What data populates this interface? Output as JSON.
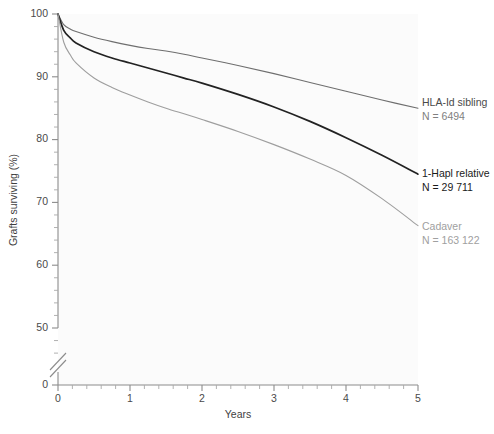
{
  "chart_data": {
    "type": "line",
    "title": "",
    "subtitle": "",
    "xlabel": "Years",
    "ylabel": "Grafts surviving (%)",
    "xlim": [
      0,
      5
    ],
    "ylim": [
      50,
      100
    ],
    "y_axis_break": true,
    "y_break_label": "0",
    "grid": false,
    "legend_position": "right-inline-annotations",
    "x_ticks": [
      "0",
      "1",
      "2",
      "3",
      "4",
      "5"
    ],
    "x_tick_values": [
      0,
      1,
      2,
      3,
      4,
      5
    ],
    "x_minor_ticks_per_interval": 4,
    "y_ticks": [
      "100",
      "90",
      "80",
      "70",
      "60",
      "50"
    ],
    "y_tick_values": [
      100,
      90,
      80,
      70,
      60,
      50
    ],
    "y_minor_ticks_per_interval": 4,
    "series": [
      {
        "name": "HLA-Id sibling",
        "label": "HLA-Id sibling",
        "n_label": "N = 6494",
        "n_value": 6494,
        "color": "#6e6e6e",
        "stroke_width": 1.1,
        "x": [
          0,
          0.08,
          0.17,
          0.25,
          0.5,
          0.75,
          1,
          1.25,
          1.5,
          1.75,
          2,
          2.5,
          3,
          3.5,
          4,
          4.5,
          5
        ],
        "values": [
          100,
          98.3,
          97.6,
          97.2,
          96.3,
          95.6,
          95.0,
          94.5,
          94.1,
          93.6,
          93.0,
          91.8,
          90.5,
          89.1,
          87.7,
          86.3,
          85.0
        ]
      },
      {
        "name": "1-Hapl relative",
        "label": "1-Hapl relative",
        "n_label": "N = 29 711",
        "n_value": 29711,
        "color": "#222222",
        "stroke_width": 1.7,
        "x": [
          0,
          0.08,
          0.17,
          0.25,
          0.5,
          0.75,
          1,
          1.25,
          1.5,
          1.75,
          2,
          2.5,
          3,
          3.5,
          4,
          4.5,
          5
        ],
        "values": [
          100,
          97.4,
          96.2,
          95.4,
          94.0,
          93.0,
          92.2,
          91.4,
          90.6,
          89.8,
          89.0,
          87.2,
          85.2,
          82.9,
          80.3,
          77.5,
          74.5
        ]
      },
      {
        "name": "Cadaver",
        "label": "Cadaver",
        "n_label": "N = 163 122",
        "n_value": 163122,
        "color": "#9e9e9e",
        "stroke_width": 1.1,
        "x": [
          0,
          0.08,
          0.17,
          0.25,
          0.5,
          0.75,
          1,
          1.25,
          1.5,
          1.75,
          2,
          2.5,
          3,
          3.5,
          4,
          4.5,
          5
        ],
        "values": [
          100,
          95.5,
          93.5,
          92.2,
          89.8,
          88.3,
          87.1,
          86.0,
          85.0,
          84.1,
          83.2,
          81.3,
          79.2,
          76.9,
          74.3,
          70.6,
          66.3
        ]
      }
    ]
  },
  "annotations": [
    {
      "label": "HLA-Id sibling",
      "n_label": "N = 6494",
      "color": "#4a4a4a",
      "n_color": "#808080"
    },
    {
      "label": "1-Hapl relative",
      "n_label": "N = 29 711",
      "color": "#1a1a1a",
      "n_color": "#1a1a1a"
    },
    {
      "label": "Cadaver",
      "n_label": "N = 163 122",
      "color": "#a0a0a0",
      "n_color": "#a0a0a0"
    }
  ],
  "axis": {
    "x_title": "Years",
    "y_title": "Grafts surviving (%)",
    "break_tick_label": "0"
  },
  "colors": {
    "background": "#ffffff",
    "plot_background": "#fbfbfb",
    "axis": "#8c8c8c",
    "tick_text": "#4a4a4a"
  }
}
